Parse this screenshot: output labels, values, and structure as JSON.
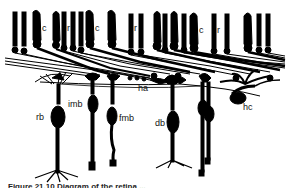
{
  "figure": {
    "labels": {
      "c1": "c",
      "r1": "r",
      "c2": "c",
      "r2": "r",
      "c3": "c",
      "r3": "r",
      "ha": "ha",
      "hc": "hc",
      "rb": "rb",
      "imb": "imb",
      "fmb": "fmb",
      "db": "db"
    },
    "caption": "Figure 21.10 Diagram of the retina ..."
  },
  "colors": {
    "ink": "#000000",
    "background": "#ffffff"
  }
}
